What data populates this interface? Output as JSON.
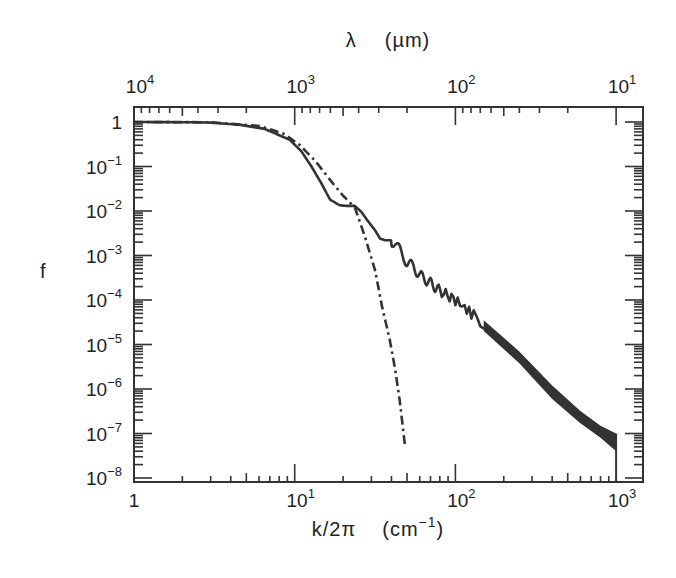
{
  "chart_data": {
    "type": "line",
    "title": "",
    "xlabel": "k/2π (cm⁻¹)",
    "xlabel_parts": {
      "main": "k/2π",
      "unit_open": "(cm",
      "unit_sup": "−1",
      "unit_close": ")"
    },
    "ylabel": "f",
    "top_xlabel": "λ (µm)",
    "top_xlabel_parts": {
      "symbol": "λ",
      "unit": "(µm)"
    },
    "xscale": "log",
    "yscale": "log",
    "xlim": [
      1,
      1000
    ],
    "ylim": [
      1e-08,
      1
    ],
    "grid": false,
    "legend": null,
    "x_ticks": [
      {
        "value": 1,
        "base": "1",
        "exp": ""
      },
      {
        "value": 10,
        "base": "10",
        "exp": "1"
      },
      {
        "value": 100,
        "base": "10",
        "exp": "2"
      },
      {
        "value": 1000,
        "base": "10",
        "exp": "3"
      }
    ],
    "top_x_ticks": [
      {
        "position_k": 1,
        "base": "10",
        "exp": "4"
      },
      {
        "position_k": 10,
        "base": "10",
        "exp": "3"
      },
      {
        "position_k": 100,
        "base": "10",
        "exp": "2"
      },
      {
        "position_k": 1000,
        "base": "10",
        "exp": "1"
      }
    ],
    "y_ticks": [
      {
        "value": 1,
        "base": "1",
        "exp": ""
      },
      {
        "value": 0.1,
        "base": "10",
        "exp": "−1"
      },
      {
        "value": 0.01,
        "base": "10",
        "exp": "−2"
      },
      {
        "value": 0.001,
        "base": "10",
        "exp": "−3"
      },
      {
        "value": 0.0001,
        "base": "10",
        "exp": "−4"
      },
      {
        "value": 1e-05,
        "base": "10",
        "exp": "−5"
      },
      {
        "value": 1e-06,
        "base": "10",
        "exp": "−6"
      },
      {
        "value": 1e-07,
        "base": "10",
        "exp": "−7"
      },
      {
        "value": 1e-08,
        "base": "10",
        "exp": "−8"
      }
    ],
    "series": [
      {
        "name": "solid",
        "style": "solid",
        "color": "#333333",
        "oscillating": true,
        "x": [
          1,
          2,
          3,
          4.6,
          6.5,
          9.3,
          11,
          12.5,
          14.5,
          16.6,
          19,
          21,
          23.7,
          26,
          28.5,
          31.6,
          34,
          36.5,
          39.5,
          42,
          45,
          50,
          55,
          60,
          70,
          80,
          100,
          130,
          190,
          280,
          450,
          650,
          800,
          1000
        ],
        "y": [
          1,
          0.99,
          0.97,
          0.86,
          0.7,
          0.4,
          0.22,
          0.11,
          0.045,
          0.018,
          0.0135,
          0.013,
          0.013,
          0.0095,
          0.006,
          0.0037,
          0.0024,
          0.0022,
          0.0022,
          0.0019,
          0.0013,
          0.0007,
          0.00055,
          0.00036,
          0.00024,
          0.00016,
          0.0001,
          4.5e-05,
          1.3e-05,
          3.5e-06,
          5.6e-07,
          1.9e-07,
          1.2e-07,
          6e-08
        ]
      },
      {
        "name": "dash-dot",
        "style": "dashdot",
        "color": "#333333",
        "oscillating": false,
        "x": [
          1,
          3,
          6.1,
          8.5,
          10.8,
          13.5,
          16.6,
          20,
          23.7,
          27.5,
          31.6,
          35,
          39,
          42,
          45,
          48.5
        ],
        "y": [
          1,
          0.99,
          0.81,
          0.55,
          0.3,
          0.13,
          0.05,
          0.022,
          0.012,
          0.0025,
          0.00047,
          7e-05,
          1.3e-05,
          3e-06,
          5.6e-07,
          5.6e-08
        ]
      }
    ],
    "envelope_band": {
      "description": "solid curve oscillations become a dense dark band at high k",
      "x": [
        150,
        250,
        400,
        600,
        800,
        1000
      ],
      "upper": [
        3.5e-05,
        7e-06,
        1.2e-06,
        3.2e-07,
        1.5e-07,
        1e-07
      ],
      "lower": [
        2e-05,
        3.8e-06,
        6e-07,
        1.7e-07,
        8e-08,
        4e-08
      ]
    }
  },
  "style": {
    "ink_color": "#333333",
    "background": "#ffffff"
  }
}
